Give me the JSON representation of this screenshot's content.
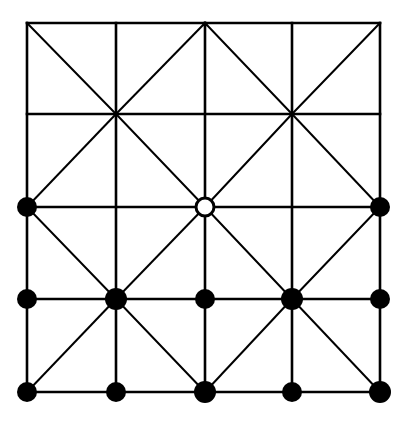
{
  "figure": {
    "background_color": "#ffffff",
    "line_color": "#000000",
    "node_fill_color": "#000000",
    "hollow_node_fill_color": "#ffffff",
    "grid_line_width": 2.6,
    "diagonal_line_width": 2.0,
    "width": 411,
    "height": 423
  },
  "chart_data": {
    "type": "diagram",
    "grid": {
      "x_coords": [
        27,
        116,
        205,
        292,
        380
      ],
      "y_coords": [
        23,
        114,
        207,
        299,
        392
      ],
      "columns": 4,
      "rows": 4,
      "border": true
    },
    "horizontal_lines": [
      {
        "y": 23,
        "x1": 27,
        "x2": 380
      },
      {
        "y": 114,
        "x1": 27,
        "x2": 380
      },
      {
        "y": 207,
        "x1": 27,
        "x2": 380
      },
      {
        "y": 299,
        "x1": 27,
        "x2": 380
      },
      {
        "y": 392,
        "x1": 27,
        "x2": 380
      }
    ],
    "vertical_lines": [
      {
        "x": 27,
        "y1": 23,
        "y2": 392
      },
      {
        "x": 116,
        "y1": 23,
        "y2": 392
      },
      {
        "x": 205,
        "y1": 23,
        "y2": 392
      },
      {
        "x": 292,
        "y1": 23,
        "y2": 392
      },
      {
        "x": 380,
        "y1": 23,
        "y2": 392
      }
    ],
    "diagonal_lines": [
      {
        "x1": 27,
        "y1": 23,
        "x2": 116,
        "y2": 114
      },
      {
        "x1": 205,
        "y1": 23,
        "x2": 116,
        "y2": 114
      },
      {
        "x1": 205,
        "y1": 23,
        "x2": 292,
        "y2": 114
      },
      {
        "x1": 380,
        "y1": 23,
        "x2": 292,
        "y2": 114
      },
      {
        "x1": 116,
        "y1": 114,
        "x2": 27,
        "y2": 207
      },
      {
        "x1": 116,
        "y1": 114,
        "x2": 205,
        "y2": 207
      },
      {
        "x1": 292,
        "y1": 114,
        "x2": 205,
        "y2": 207
      },
      {
        "x1": 292,
        "y1": 114,
        "x2": 380,
        "y2": 207
      },
      {
        "x1": 27,
        "y1": 207,
        "x2": 116,
        "y2": 299
      },
      {
        "x1": 205,
        "y1": 207,
        "x2": 116,
        "y2": 299
      },
      {
        "x1": 205,
        "y1": 207,
        "x2": 292,
        "y2": 299
      },
      {
        "x1": 380,
        "y1": 207,
        "x2": 292,
        "y2": 299
      },
      {
        "x1": 116,
        "y1": 299,
        "x2": 27,
        "y2": 392
      },
      {
        "x1": 116,
        "y1": 299,
        "x2": 205,
        "y2": 392
      },
      {
        "x1": 292,
        "y1": 299,
        "x2": 205,
        "y2": 392
      },
      {
        "x1": 292,
        "y1": 299,
        "x2": 380,
        "y2": 392
      }
    ],
    "filled_nodes": [
      {
        "x": 27,
        "y": 207,
        "r": 10,
        "label": "left-mid-vertex"
      },
      {
        "x": 380,
        "y": 207,
        "r": 10,
        "label": "right-mid-vertex"
      },
      {
        "x": 27,
        "y": 299,
        "r": 10,
        "label": "row3-col0-vertex"
      },
      {
        "x": 116,
        "y": 299,
        "r": 11,
        "label": "row3-col1-vertex"
      },
      {
        "x": 205,
        "y": 299,
        "r": 10,
        "label": "row3-col2-vertex"
      },
      {
        "x": 292,
        "y": 299,
        "r": 11,
        "label": "row3-col3-vertex"
      },
      {
        "x": 380,
        "y": 299,
        "r": 10,
        "label": "row3-col4-vertex"
      },
      {
        "x": 27,
        "y": 392,
        "r": 10,
        "label": "row4-col0-vertex"
      },
      {
        "x": 116,
        "y": 392,
        "r": 10,
        "label": "row4-col1-vertex"
      },
      {
        "x": 205,
        "y": 392,
        "r": 11,
        "label": "row4-col2-vertex"
      },
      {
        "x": 292,
        "y": 392,
        "r": 10,
        "label": "row4-col3-vertex"
      },
      {
        "x": 380,
        "y": 392,
        "r": 11,
        "label": "row4-col4-vertex"
      }
    ],
    "hollow_nodes": [
      {
        "x": 205,
        "y": 207,
        "r": 9,
        "stroke_width": 3,
        "label": "center-hollow-vertex"
      }
    ],
    "small_dots": [
      {
        "x": 205,
        "y": 24,
        "r": 2.5,
        "label": "top-apex-dot"
      }
    ],
    "filled_node_count": 12,
    "hollow_node_count": 1
  }
}
